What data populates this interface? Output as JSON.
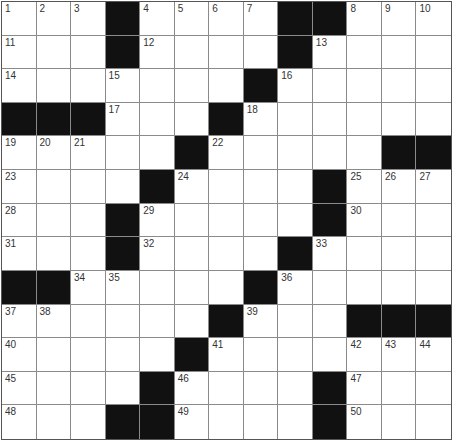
{
  "puzzle": {
    "rows": 13,
    "cols": 13,
    "colors": {
      "black": "#111111",
      "white": "#ffffff",
      "gridline": "#8a8a8a",
      "number": "#333333"
    },
    "layout": [
      "...#....##...",
      "...#....#....",
      ".......#.....",
      "###...#......",
      ".....#.....##",
      "....#....#...",
      "...#.....#...",
      "...#....#....",
      "##.....#.....",
      "......#...###",
      ".....#.......",
      "....#....#...",
      "...##....#..."
    ],
    "numbers": [
      {
        "r": 0,
        "c": 0,
        "n": "1"
      },
      {
        "r": 0,
        "c": 1,
        "n": "2"
      },
      {
        "r": 0,
        "c": 2,
        "n": "3"
      },
      {
        "r": 0,
        "c": 4,
        "n": "4"
      },
      {
        "r": 0,
        "c": 5,
        "n": "5"
      },
      {
        "r": 0,
        "c": 6,
        "n": "6"
      },
      {
        "r": 0,
        "c": 7,
        "n": "7"
      },
      {
        "r": 0,
        "c": 10,
        "n": "8"
      },
      {
        "r": 0,
        "c": 11,
        "n": "9"
      },
      {
        "r": 0,
        "c": 12,
        "n": "10"
      },
      {
        "r": 1,
        "c": 0,
        "n": "11"
      },
      {
        "r": 1,
        "c": 4,
        "n": "12"
      },
      {
        "r": 1,
        "c": 9,
        "n": "13"
      },
      {
        "r": 2,
        "c": 0,
        "n": "14"
      },
      {
        "r": 2,
        "c": 3,
        "n": "15"
      },
      {
        "r": 2,
        "c": 8,
        "n": "16"
      },
      {
        "r": 3,
        "c": 3,
        "n": "17"
      },
      {
        "r": 3,
        "c": 7,
        "n": "18"
      },
      {
        "r": 4,
        "c": 0,
        "n": "19"
      },
      {
        "r": 4,
        "c": 1,
        "n": "20"
      },
      {
        "r": 4,
        "c": 2,
        "n": "21"
      },
      {
        "r": 4,
        "c": 6,
        "n": "22"
      },
      {
        "r": 5,
        "c": 0,
        "n": "23"
      },
      {
        "r": 5,
        "c": 5,
        "n": "24"
      },
      {
        "r": 5,
        "c": 10,
        "n": "25"
      },
      {
        "r": 5,
        "c": 11,
        "n": "26"
      },
      {
        "r": 5,
        "c": 12,
        "n": "27"
      },
      {
        "r": 6,
        "c": 0,
        "n": "28"
      },
      {
        "r": 6,
        "c": 4,
        "n": "29"
      },
      {
        "r": 6,
        "c": 10,
        "n": "30"
      },
      {
        "r": 7,
        "c": 0,
        "n": "31"
      },
      {
        "r": 7,
        "c": 4,
        "n": "32"
      },
      {
        "r": 7,
        "c": 9,
        "n": "33"
      },
      {
        "r": 8,
        "c": 2,
        "n": "34"
      },
      {
        "r": 8,
        "c": 3,
        "n": "35"
      },
      {
        "r": 8,
        "c": 8,
        "n": "36"
      },
      {
        "r": 9,
        "c": 0,
        "n": "37"
      },
      {
        "r": 9,
        "c": 1,
        "n": "38"
      },
      {
        "r": 9,
        "c": 7,
        "n": "39"
      },
      {
        "r": 10,
        "c": 0,
        "n": "40"
      },
      {
        "r": 10,
        "c": 6,
        "n": "41"
      },
      {
        "r": 10,
        "c": 10,
        "n": "42"
      },
      {
        "r": 10,
        "c": 11,
        "n": "43"
      },
      {
        "r": 10,
        "c": 12,
        "n": "44"
      },
      {
        "r": 11,
        "c": 0,
        "n": "45"
      },
      {
        "r": 11,
        "c": 5,
        "n": "46"
      },
      {
        "r": 11,
        "c": 10,
        "n": "47"
      },
      {
        "r": 12,
        "c": 0,
        "n": "48"
      },
      {
        "r": 12,
        "c": 5,
        "n": "49"
      },
      {
        "r": 12,
        "c": 10,
        "n": "50"
      }
    ]
  }
}
